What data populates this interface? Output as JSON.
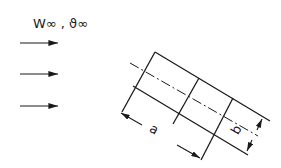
{
  "flow": {
    "label": "W∞ , ϑ∞",
    "arrows": [
      {
        "x1": 20,
        "y1": 43,
        "x2": 58,
        "y2": 43
      },
      {
        "x1": 20,
        "y1": 74,
        "x2": 58,
        "y2": 74
      },
      {
        "x1": 20,
        "y1": 106,
        "x2": 58,
        "y2": 106
      }
    ]
  },
  "body": {
    "dimension_a": "a",
    "dimension_b": "b"
  },
  "colors": {
    "ink": "#1a1a1a",
    "background": "#ffffff"
  }
}
